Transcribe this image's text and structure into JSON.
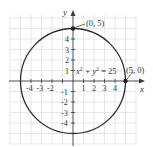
{
  "diagram": {
    "axes": {
      "x_label": "x",
      "y_label": "y",
      "x_ticks": [
        "-4",
        "-3",
        "-2",
        "1",
        "2",
        "3",
        "4"
      ],
      "y_ticks": [
        "4",
        "3",
        "2",
        "1",
        "-1",
        "-2",
        "-3",
        "-4"
      ]
    },
    "equation": {
      "text_prefix": "x",
      "sup1": "2",
      "mid": " + y",
      "sup2": "2",
      "suffix": " = 25"
    },
    "points": [
      {
        "label": "(0, 5)",
        "x": 0,
        "y": 5
      },
      {
        "label": "(5, 0)",
        "x": 5,
        "y": 0
      }
    ],
    "circle": {
      "center": [
        0,
        0
      ],
      "radius": 5
    },
    "colors": {
      "grid": "#dcdcdc",
      "axis": "#3a3a3a",
      "curve": "#2e2e2e",
      "text": "#333333",
      "background": "#ffffff"
    }
  }
}
